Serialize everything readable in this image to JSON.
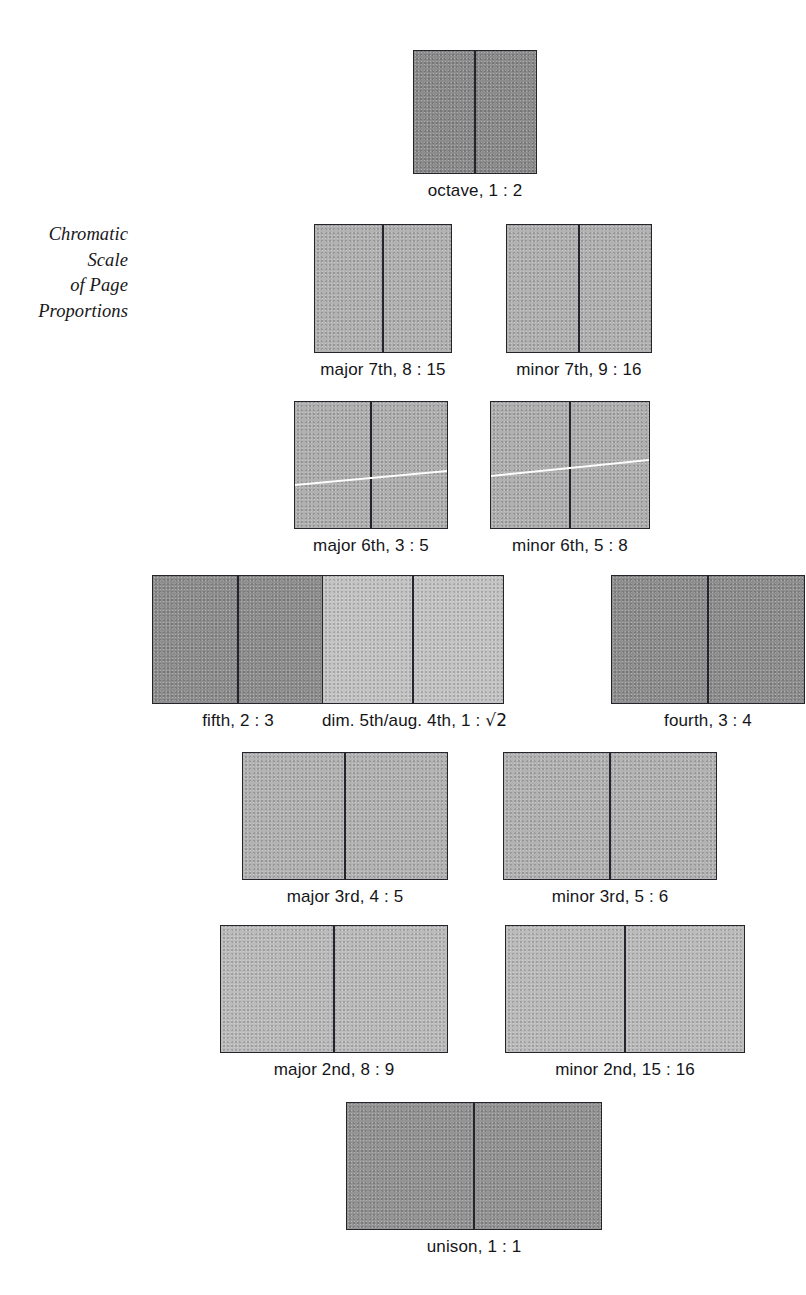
{
  "figure": {
    "title": "Chromatic\nScale\nof Page\nProportions",
    "background_color": "#ffffff",
    "ink_color": "#24242a",
    "shade_dark": "#8a8a8a",
    "shade_light": "#b9b9b9",
    "shade_pale": "#c6c6c6"
  },
  "chart_data": {
    "type": "diagram",
    "title": "Chromatic Scale of Page Proportions",
    "categories": [
      "octave",
      "major 7th",
      "minor 7th",
      "major 6th",
      "minor 6th",
      "fifth",
      "dim. 5th/aug. 4th",
      "fourth",
      "major 3rd",
      "minor 3rd",
      "major 2nd",
      "minor 2nd",
      "unison"
    ],
    "values": [
      0.5,
      0.5333,
      0.5625,
      0.6,
      0.625,
      0.6667,
      0.7071,
      0.75,
      0.8,
      0.8333,
      0.8889,
      0.9375,
      1.0
    ],
    "xlabel": "",
    "ylabel": "page width : height ratio",
    "legend": false,
    "grid": false
  },
  "rows": [
    {
      "name": "octave-row",
      "top": 50,
      "items": [
        {
          "id": "octave",
          "label": "octave, 1 : 2",
          "interval": "octave",
          "ratio": "1 : 2",
          "left": 413,
          "page_w": 62,
          "page_h": 124,
          "shade": "#8c8c8c",
          "diagonal": null
        }
      ]
    },
    {
      "name": "seventh-row",
      "top": 224,
      "items": [
        {
          "id": "major-7th",
          "label": "major 7th, 8 : 15",
          "interval": "major 7th",
          "ratio": "8 : 15",
          "left": 314,
          "page_w": 69,
          "page_h": 129,
          "shade": "#b2b2b2",
          "diagonal": null
        },
        {
          "id": "minor-7th",
          "label": "minor 7th, 9 : 16",
          "interval": "minor 7th",
          "ratio": "9 : 16",
          "left": 506,
          "page_w": 73,
          "page_h": 129,
          "shade": "#b2b2b2",
          "diagonal": null
        }
      ]
    },
    {
      "name": "sixth-row",
      "top": 401,
      "items": [
        {
          "id": "major-6th",
          "label": "major 6th, 3 : 5",
          "interval": "major 6th",
          "ratio": "3 : 5",
          "left": 294,
          "page_w": 77,
          "page_h": 128,
          "shade": "#b0b0b0",
          "diagonal": {
            "y_left": 82,
            "y_right": 68
          }
        },
        {
          "id": "minor-6th",
          "label": "minor 6th, 5 : 8",
          "interval": "minor 6th",
          "ratio": "5 : 8",
          "left": 490,
          "page_w": 80,
          "page_h": 128,
          "shade": "#b0b0b0",
          "diagonal": {
            "y_left": 73,
            "y_right": 57
          }
        }
      ]
    },
    {
      "name": "fifth-row",
      "top": 575,
      "items": [
        {
          "id": "fifth",
          "label": "fifth, 2 : 3",
          "interval": "fifth",
          "ratio": "2 : 3",
          "left": 152,
          "page_w": 86,
          "page_h": 129,
          "shade": "#8f8f8f",
          "diagonal": null
        },
        {
          "id": "dim-5th-aug-4th",
          "label_prefix": "dim. 5th/aug. 4th, 1 : ",
          "label_radical": "√2",
          "label": "dim. 5th/aug. 4th, 1 : √2",
          "interval": "dim. 5th/aug. 4th",
          "ratio": "1 : √2",
          "left": 322,
          "page_w": 91,
          "page_h": 129,
          "shade": "#c4c4c4",
          "diagonal": null
        },
        {
          "id": "fourth",
          "label": "fourth, 3 : 4",
          "interval": "fourth",
          "ratio": "3 : 4",
          "left": 611,
          "page_w": 97,
          "page_h": 129,
          "shade": "#8f8f8f",
          "diagonal": null
        }
      ]
    },
    {
      "name": "third-row",
      "top": 752,
      "items": [
        {
          "id": "major-3rd",
          "label": "major 3rd, 4 : 5",
          "interval": "major 3rd",
          "ratio": "4 : 5",
          "left": 242,
          "page_w": 103,
          "page_h": 128,
          "shade": "#b3b3b3",
          "diagonal": null
        },
        {
          "id": "minor-3rd",
          "label": "minor 3rd, 5 : 6",
          "interval": "minor 3rd",
          "ratio": "5 : 6",
          "left": 503,
          "page_w": 107,
          "page_h": 128,
          "shade": "#b3b3b3",
          "diagonal": null
        }
      ]
    },
    {
      "name": "second-row",
      "top": 925,
      "items": [
        {
          "id": "major-2nd",
          "label": "major 2nd, 8 : 9",
          "interval": "major 2nd",
          "ratio": "8 : 9",
          "left": 220,
          "page_w": 114,
          "page_h": 128,
          "shade": "#bcbcbc",
          "diagonal": null
        },
        {
          "id": "minor-2nd",
          "label": "minor 2nd, 15 : 16",
          "interval": "minor 2nd",
          "ratio": "15 : 16",
          "left": 505,
          "page_w": 120,
          "page_h": 128,
          "shade": "#bcbcbc",
          "diagonal": null
        }
      ]
    },
    {
      "name": "unison-row",
      "top": 1102,
      "items": [
        {
          "id": "unison",
          "label": "unison, 1 : 1",
          "interval": "unison",
          "ratio": "1 : 1",
          "left": 346,
          "page_w": 128,
          "page_h": 128,
          "shade": "#949494",
          "diagonal": null
        }
      ]
    }
  ]
}
